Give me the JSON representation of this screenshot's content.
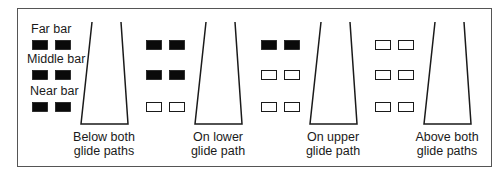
{
  "colors": {
    "on": "#0a0a0a",
    "off": "#ffffff",
    "stroke": "#1a1a1a",
    "frame": "#444444"
  },
  "legend": [
    "Far bar",
    "Middle bar",
    "Near bar"
  ],
  "panels": [
    {
      "caption": [
        "Below both",
        "glide paths"
      ],
      "lights": [
        "on",
        "on",
        "on"
      ],
      "show_legend": true
    },
    {
      "caption": [
        "On lower",
        "glide path"
      ],
      "lights": [
        "on",
        "on",
        "off"
      ],
      "show_legend": false
    },
    {
      "caption": [
        "On upper",
        "glide path"
      ],
      "lights": [
        "on",
        "off",
        "off"
      ],
      "show_legend": false
    },
    {
      "caption": [
        "Above both",
        "glide paths"
      ],
      "lights": [
        "off",
        "off",
        "off"
      ],
      "show_legend": false
    }
  ]
}
